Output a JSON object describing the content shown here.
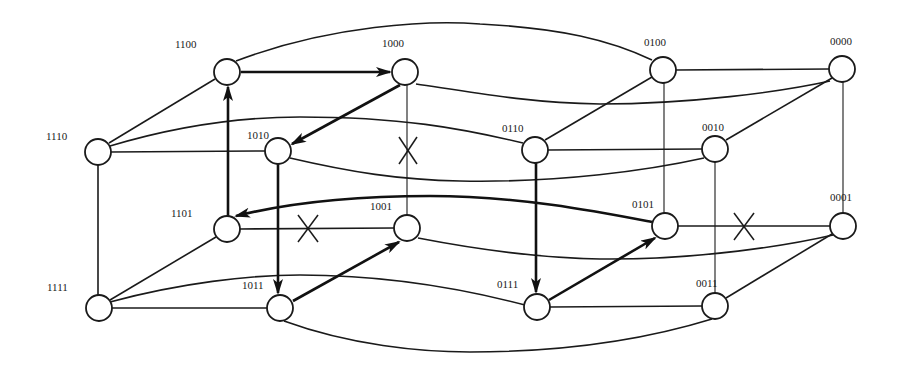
{
  "diagram": {
    "type": "4-dimensional hypercube (Q4) with routing path",
    "nodes": [
      {
        "id": "1100",
        "label": "1100",
        "x": 227,
        "y": 72
      },
      {
        "id": "1000",
        "label": "1000",
        "x": 405,
        "y": 72
      },
      {
        "id": "0100",
        "label": "0100",
        "x": 663,
        "y": 70
      },
      {
        "id": "0000",
        "label": "0000",
        "x": 842,
        "y": 69
      },
      {
        "id": "1110",
        "label": "1110",
        "x": 98,
        "y": 152
      },
      {
        "id": "1010",
        "label": "1010",
        "x": 278,
        "y": 151
      },
      {
        "id": "0110",
        "label": "0110",
        "x": 535,
        "y": 150
      },
      {
        "id": "0010",
        "label": "0010",
        "x": 715,
        "y": 149
      },
      {
        "id": "1101",
        "label": "1101",
        "x": 227,
        "y": 229
      },
      {
        "id": "1001",
        "label": "1001",
        "x": 407,
        "y": 228
      },
      {
        "id": "0101",
        "label": "0101",
        "x": 665,
        "y": 226
      },
      {
        "id": "0001",
        "label": "0001",
        "x": 843,
        "y": 226
      },
      {
        "id": "1111",
        "label": "1111",
        "x": 99,
        "y": 308
      },
      {
        "id": "1011",
        "label": "1011",
        "x": 280,
        "y": 308
      },
      {
        "id": "0111",
        "label": "0111",
        "x": 537,
        "y": 307
      },
      {
        "id": "0011",
        "label": "0011",
        "x": 715,
        "y": 306
      }
    ],
    "faulty_links": [
      {
        "from": "1000",
        "to": "1001",
        "mark": "X"
      },
      {
        "from": "1101",
        "to": "1001",
        "mark": "X"
      },
      {
        "from": "0101",
        "to": "0001",
        "mark": "X"
      }
    ],
    "directed_path": [
      {
        "from": "1100",
        "to": "1000"
      },
      {
        "from": "1000",
        "to": "1010"
      },
      {
        "from": "1010",
        "to": "1011"
      },
      {
        "from": "1011",
        "to": "1001"
      },
      {
        "from": "0101",
        "to": "1101"
      },
      {
        "from": "1101",
        "to": "1100"
      },
      {
        "from": "0110",
        "to": "0111"
      },
      {
        "from": "0111",
        "to": "0101"
      }
    ],
    "labels": {
      "n1100": "1100",
      "n1000": "1000",
      "n0100": "0100",
      "n0000": "0000",
      "n1110": "1110",
      "n1010": "1010",
      "n0110": "0110",
      "n0010": "0010",
      "n1101": "1101",
      "n1001": "1001",
      "n0101": "0101",
      "n0001": "0001",
      "n1111": "1111",
      "n1011": "1011",
      "n0111": "0111",
      "n0011": "0011"
    },
    "fault_mark": "X"
  }
}
